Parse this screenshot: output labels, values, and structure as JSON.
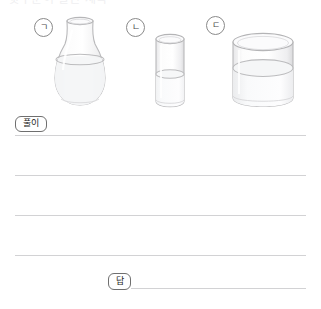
{
  "page": {
    "cut_heading": "윗부분이 잘린 제목",
    "background_color": "#ffffff",
    "line_color": "#d2d2d4",
    "ink_color": "#3a3a3a"
  },
  "figure": {
    "vessels": [
      {
        "label": "ㄱ",
        "name": "flask",
        "shape": "round-bottom flask with narrow neck",
        "fill_description": "water filled to the shoulder"
      },
      {
        "label": "ㄴ",
        "name": "narrow-cylinder",
        "shape": "tall narrow cylinder",
        "fill_description": "water filled about half"
      },
      {
        "label": "ㄷ",
        "name": "wide-cylinder",
        "shape": "short wide cylinder",
        "fill_description": "water filled a little over half"
      }
    ]
  },
  "solution": {
    "solve_tag": "풀이",
    "answer_tag": "답",
    "write_lines": [
      "",
      "",
      "",
      ""
    ],
    "answer_line": ""
  }
}
